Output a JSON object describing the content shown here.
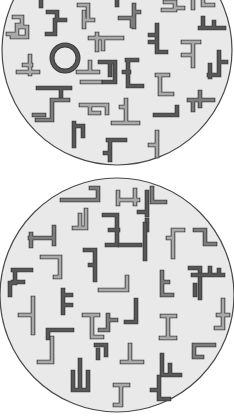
{
  "colors": {
    "page_background": "#ffffff",
    "disc_fill": "#e9e9e9",
    "disc_border": "#4a4a4a",
    "tone_light": "#a9a9a9",
    "tone_medium": "#7d7d7d",
    "tone_dark": "#585858",
    "outline": "#3c3c3c"
  },
  "displays": [
    {
      "name": "target-display-top",
      "cx": 117,
      "cy": 50,
      "r": 115,
      "target": {
        "shape": "ring",
        "cx": 65,
        "cy": 58,
        "r": 13,
        "tone": "dark"
      },
      "items": [
        {
          "d": "M41 0 v6",
          "tone": "dark"
        },
        {
          "d": "M14 17 h8 v8 h-5 v9 h-9 M17 27 h10 v10 h-15",
          "tone": "light"
        },
        {
          "d": "M48 12 h9 v8 h8 M55 20 v14 h-8",
          "tone": "dark"
        },
        {
          "d": "M79 5 h9 v15 M84 12 v15 M84 20 h9",
          "tone": "light"
        },
        {
          "d": "M117 0 v5",
          "tone": "dark"
        },
        {
          "d": "M120 18 h12 v8 M134 5 v22 M134 12 h5",
          "tone": "medium"
        },
        {
          "d": "M165 2 h10 v8 h-12 M175 8 h8",
          "tone": "light"
        },
        {
          "d": "M193 0 v8 M203 0 v5 h10",
          "tone": "light"
        },
        {
          "d": "M200 28 h24 M203 18 v10 M214 22 v6",
          "tone": "dark"
        },
        {
          "d": "M90 38 h32 M97 34 v16 M103 40 v9",
          "tone": "light"
        },
        {
          "d": "M157 25 v27 h9 M150 35 h7 M150 42 h7",
          "tone": "dark"
        },
        {
          "d": "M183 42 h16 M193 42 v24 M183 55 h10",
          "tone": "light"
        },
        {
          "d": "M219 52 v23 h-10 M219 62 h7 M210 65 v12",
          "tone": "dark"
        },
        {
          "d": "M18 72 h20 M30 56 v18 M24 65 h7",
          "tone": "light"
        },
        {
          "d": "M100 62 h15 v20 h-11 M110 65 v10",
          "tone": "dark"
        },
        {
          "d": "M127 60 h10 M128 60 v26 h14 M124 72 h5",
          "tone": "dark"
        },
        {
          "d": "M78 72 h20 M90 70 v-8 M82 82 h18",
          "tone": "light"
        },
        {
          "d": "M157 75 h11 M160 75 v19 h12",
          "tone": "light"
        },
        {
          "d": "M38 88 h32 M61 88 v8",
          "tone": "dark"
        },
        {
          "d": "M54 100 h14 M52 100 v20 h-15 M44 115 h-10",
          "tone": "medium"
        },
        {
          "d": "M81 105 h26 v8 M90 105 v8 h9",
          "tone": "light"
        },
        {
          "d": "M126 100 v20 M113 123 h25 M126 107 h-5",
          "tone": "light"
        },
        {
          "d": "M189 100 h24 M200 92 v14 M193 100 v10",
          "tone": "medium"
        },
        {
          "d": "M155 115 h22 v-8",
          "tone": "dark"
        },
        {
          "d": "M74 123 v23 M74 126 h9 v10",
          "tone": "dark"
        },
        {
          "d": "M157 132 v24 M150 145 h7",
          "tone": "light"
        },
        {
          "d": "M108 140 h17 M110 140 v20 M110 153 h-5",
          "tone": "dark"
        }
      ]
    },
    {
      "name": "search-display-bottom",
      "cx": 117,
      "cy": 295,
      "r": 117,
      "items": [
        {
          "d": "M62 200 h36 v-12 h-7",
          "tone": "medium"
        },
        {
          "d": "M118 200 h20 M118 192 v12 M135 190 v14",
          "tone": "light"
        },
        {
          "d": "M152 188 v14 h13",
          "tone": "medium"
        },
        {
          "d": "M86 210 v18 h-12 M80 215 v10",
          "tone": "light"
        },
        {
          "d": "M104 215 h13 v30 h-10 M110 230 h8",
          "tone": "dark"
        },
        {
          "d": "M147 192 v20 h-8 M147 205 v10 M147 220 v10",
          "tone": "dark"
        },
        {
          "d": "M30 238 h23 M54 227 v17 M31 234 v12",
          "tone": "medium"
        },
        {
          "d": "M145 224 v35 M140 245 h-20",
          "tone": "dark"
        },
        {
          "d": "M173 230 h10 M173 230 v27 M168 238 h5",
          "tone": "light"
        },
        {
          "d": "M195 230 h10 v14 h10",
          "tone": "medium"
        },
        {
          "d": "M42 257 h18 v20 M55 277 h5",
          "tone": "light"
        },
        {
          "d": "M85 250 h10 v30 M90 265 h5",
          "tone": "dark"
        },
        {
          "d": "M13 270 h18 M15 270 v13 h-5 v12 M13 282 h10",
          "tone": "dark"
        },
        {
          "d": "M100 290 h27 v-13",
          "tone": "light"
        },
        {
          "d": "M162 272 v23 h10 M162 282 h6",
          "tone": "medium"
        },
        {
          "d": "M190 268 h10 v30 M195 285 v10",
          "tone": "dark"
        },
        {
          "d": "M193 275 h30 M210 268 v7 M219 270 v5",
          "tone": "dark"
        },
        {
          "d": "M63 290 v23 M63 295 h8 M63 305 h8",
          "tone": "dark"
        },
        {
          "d": "M223 300 v28 h-7 M218 315 h10",
          "tone": "light"
        },
        {
          "d": "M20 315 h13 v10 M33 298 v35",
          "tone": "light"
        },
        {
          "d": "M84 315 h14 M92 315 v22 h10",
          "tone": "light"
        },
        {
          "d": "M108 315 v15 h-8 M108 320 h8",
          "tone": "medium"
        },
        {
          "d": "M136 300 v22 h-10",
          "tone": "dark"
        },
        {
          "d": "M162 316 h13 M168 316 v22 M161 338 h14",
          "tone": "light"
        },
        {
          "d": "M48 330 h24 M48 330 v8",
          "tone": "dark"
        },
        {
          "d": "M194 345 h20 M194 345 v12 h8",
          "tone": "medium"
        },
        {
          "d": "M52 338 v24 h-13",
          "tone": "light"
        },
        {
          "d": "M96 345 h10 v10 M98 350 v8",
          "tone": "dark"
        },
        {
          "d": "M130 345 v17 h-8 M122 362 h20",
          "tone": "light"
        },
        {
          "d": "M162 355 v20 h18 M170 365 v10",
          "tone": "dark"
        },
        {
          "d": "M80 360 v30 M73 372 v18 h15 v-18",
          "tone": "dark"
        },
        {
          "d": "M115 385 h13 M121 385 v20 h-6",
          "tone": "light"
        },
        {
          "d": "M159 377 v22 h10 M152 390 h7",
          "tone": "dark"
        }
      ]
    }
  ]
}
